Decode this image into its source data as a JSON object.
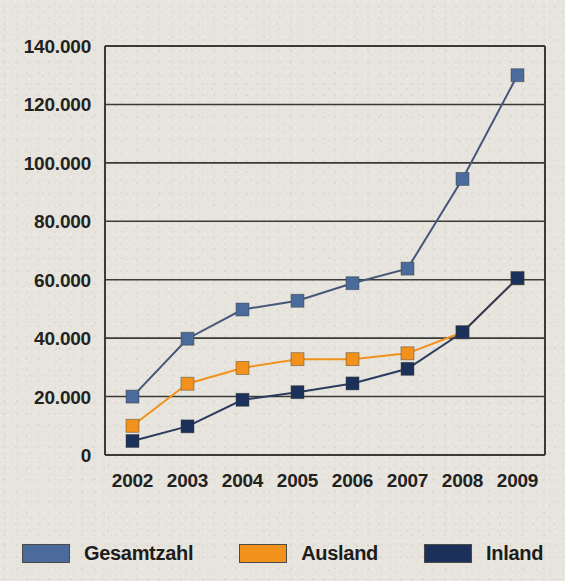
{
  "chart_data": {
    "type": "line",
    "title": "",
    "subtitle": "",
    "xlabel": "",
    "ylabel": "",
    "categories": [
      "2002",
      "2003",
      "2004",
      "2005",
      "2006",
      "2007",
      "2008",
      "2009"
    ],
    "x_tick_labels": [
      "2002",
      "2003",
      "2004",
      "2005",
      "2006",
      "2007",
      "2008",
      "2009"
    ],
    "y_tick_labels": [
      "0",
      "20.000",
      "40.000",
      "60.000",
      "80.000",
      "100.000",
      "120.000",
      "140.000"
    ],
    "y_tick_values": [
      0,
      20000,
      40000,
      60000,
      80000,
      100000,
      120000,
      140000
    ],
    "ylim": [
      0,
      140000
    ],
    "grid": "horizontal",
    "legend_position": "bottom",
    "number_format": "de-DE",
    "series": [
      {
        "name": "Gesamtzahl",
        "color": "#4a6b9c",
        "marker": "square",
        "values": [
          20000,
          39800,
          49800,
          52800,
          58800,
          63800,
          94500,
          130000
        ]
      },
      {
        "name": "Ausland",
        "color": "#f2921d",
        "marker": "square",
        "values": [
          10000,
          24400,
          29800,
          32800,
          32800,
          34800,
          42000,
          60500
        ]
      },
      {
        "name": "Inland",
        "color": "#1c3159",
        "marker": "square",
        "values": [
          4800,
          9800,
          18900,
          21500,
          24500,
          29500,
          42000,
          60500
        ]
      }
    ]
  },
  "legend": {
    "items": [
      {
        "label": "Gesamtzahl",
        "color": "#4a6b9c"
      },
      {
        "label": "Ausland",
        "color": "#f2921d"
      },
      {
        "label": "Inland",
        "color": "#1c3159"
      }
    ]
  },
  "colors": {
    "background": "#e6e4dd",
    "axis": "#3a3a36",
    "grid": "#3a3a36",
    "text": "#23221f"
  }
}
